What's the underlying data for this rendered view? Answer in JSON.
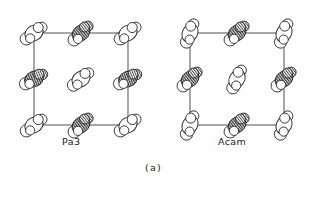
{
  "figure": {
    "panel_label": "(a)",
    "background_color": "#ffffff",
    "line_color": "#3c3c3c",
    "outline_color": "#222222",
    "hatch_color": "#555555",
    "fill_white": "#ffffff",
    "fill_shaded": "#b8b8b8"
  },
  "panels": [
    {
      "id": "pa3",
      "label": "Pa3",
      "cell": {
        "x": 34,
        "y": 33,
        "width": 94,
        "height": 92
      },
      "molecules": [
        {
          "cx": 34,
          "cy": 33,
          "angle": -30,
          "fill": "white",
          "pos": "corner-tl"
        },
        {
          "cx": 128,
          "cy": 33,
          "angle": -30,
          "fill": "white",
          "pos": "corner-tr"
        },
        {
          "cx": 34,
          "cy": 125,
          "angle": -30,
          "fill": "white",
          "pos": "corner-bl"
        },
        {
          "cx": 128,
          "cy": 125,
          "angle": -30,
          "fill": "white",
          "pos": "corner-br"
        },
        {
          "cx": 81,
          "cy": 33,
          "angle": -38,
          "fill": "hatch",
          "pos": "edge-top"
        },
        {
          "cx": 81,
          "cy": 125,
          "angle": -38,
          "fill": "hatch",
          "pos": "edge-bottom"
        },
        {
          "cx": 34,
          "cy": 79,
          "angle": -22,
          "fill": "hatch",
          "pos": "edge-left"
        },
        {
          "cx": 128,
          "cy": 79,
          "angle": -22,
          "fill": "hatch",
          "pos": "edge-right"
        },
        {
          "cx": 81,
          "cy": 79,
          "angle": -32,
          "fill": "white",
          "pos": "center"
        }
      ]
    },
    {
      "id": "acam",
      "label": "Acam",
      "cell": {
        "x": 190,
        "y": 33,
        "width": 94,
        "height": 92
      },
      "molecules": [
        {
          "cx": 190,
          "cy": 33,
          "angle": -62,
          "fill": "white",
          "pos": "corner-tl"
        },
        {
          "cx": 284,
          "cy": 33,
          "angle": -62,
          "fill": "white",
          "pos": "corner-tr"
        },
        {
          "cx": 190,
          "cy": 125,
          "angle": -62,
          "fill": "white",
          "pos": "corner-bl"
        },
        {
          "cx": 284,
          "cy": 125,
          "angle": -62,
          "fill": "white",
          "pos": "corner-br"
        },
        {
          "cx": 237,
          "cy": 33,
          "angle": -38,
          "fill": "hatch",
          "pos": "edge-top"
        },
        {
          "cx": 237,
          "cy": 125,
          "angle": -38,
          "fill": "hatch",
          "pos": "edge-bottom"
        },
        {
          "cx": 190,
          "cy": 79,
          "angle": -38,
          "fill": "hatch",
          "pos": "edge-left"
        },
        {
          "cx": 284,
          "cy": 79,
          "angle": -38,
          "fill": "hatch",
          "pos": "edge-right"
        },
        {
          "cx": 237,
          "cy": 79,
          "angle": -58,
          "fill": "white",
          "pos": "center"
        }
      ]
    }
  ]
}
